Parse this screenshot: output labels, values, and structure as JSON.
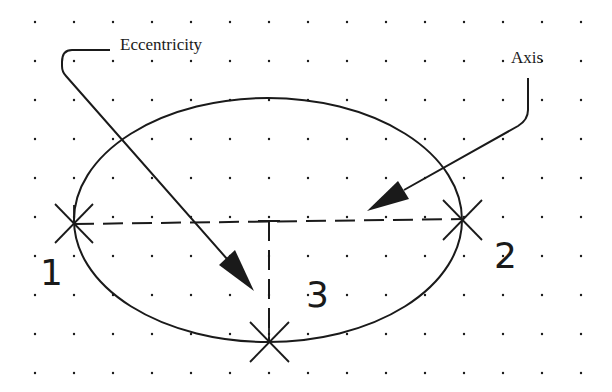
{
  "diagram": {
    "background": "#ffffff",
    "ink_color": "#1a1a1a",
    "grid": {
      "spacing": 39,
      "origin_x": 35,
      "origin_y": 22,
      "cols": 15,
      "rows": 10,
      "dot_radius": 1.2
    },
    "labels": {
      "eccentricity": "Eccentricity",
      "axis": "Axis",
      "point_1": "1",
      "point_2": "2",
      "point_3": "3"
    },
    "ellipse": {
      "cx": 268,
      "cy": 220,
      "rx": 194,
      "ry": 122
    },
    "points": [
      {
        "id": "1",
        "x": 74,
        "y": 223
      },
      {
        "id": "2",
        "x": 462,
        "y": 220
      },
      {
        "id": "3",
        "x": 268,
        "y": 342
      }
    ]
  }
}
